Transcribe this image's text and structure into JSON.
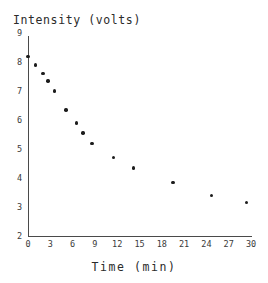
{
  "chart_data": {
    "type": "scatter",
    "title": "Intensity (volts)",
    "xlabel": "Time (min)",
    "ylabel": "Intensity (volts)",
    "xlim": [
      0,
      30
    ],
    "ylim": [
      2,
      9
    ],
    "grid": false,
    "legend": null,
    "xticks": [
      0,
      3,
      6,
      9,
      12,
      15,
      18,
      21,
      24,
      27,
      30
    ],
    "xtick_labels": [
      "0",
      "3",
      "6",
      "9",
      "12",
      "15",
      "18",
      "21",
      "24",
      "27",
      "30"
    ],
    "yticks": [
      2,
      3,
      4,
      5,
      6,
      7,
      8,
      9
    ],
    "ytick_labels": [
      "2",
      "3",
      "4",
      "5",
      "6",
      "7",
      "8",
      "9"
    ],
    "marker": "filled-circle",
    "marker_color": "#1c1c1c",
    "x": [
      0.0,
      1.0,
      2.0,
      2.7,
      3.6,
      5.1,
      6.5,
      7.4,
      8.6,
      11.5,
      14.2,
      19.5,
      24.7,
      29.4
    ],
    "y": [
      8.2,
      7.9,
      7.6,
      7.35,
      7.0,
      6.35,
      5.9,
      5.55,
      5.2,
      4.7,
      4.35,
      3.85,
      3.4,
      3.15
    ],
    "points": [
      {
        "x": 0.0,
        "y": 8.2
      },
      {
        "x": 1.0,
        "y": 7.9
      },
      {
        "x": 2.0,
        "y": 7.6
      },
      {
        "x": 2.7,
        "y": 7.35
      },
      {
        "x": 3.6,
        "y": 7.0
      },
      {
        "x": 5.1,
        "y": 6.35
      },
      {
        "x": 6.5,
        "y": 5.9
      },
      {
        "x": 7.4,
        "y": 5.55
      },
      {
        "x": 8.6,
        "y": 5.2
      },
      {
        "x": 11.5,
        "y": 4.7
      },
      {
        "x": 14.2,
        "y": 4.35
      },
      {
        "x": 19.5,
        "y": 3.85
      },
      {
        "x": 24.7,
        "y": 3.4
      },
      {
        "x": 29.4,
        "y": 3.15
      }
    ]
  },
  "axes": {
    "line_color": "#4a4a4a"
  }
}
